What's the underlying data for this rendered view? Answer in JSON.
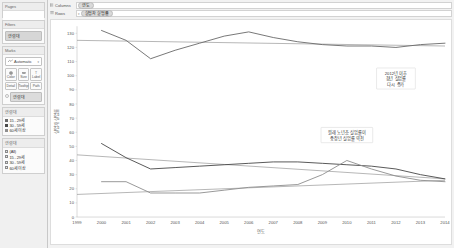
{
  "sidebar": {
    "pages": {
      "title": "Pages"
    },
    "filters": {
      "title": "Filters",
      "pills": [
        "연령대"
      ]
    },
    "marks": {
      "title": "Marks",
      "type_label": "Automatic",
      "type_icon": "line-mark-icon",
      "caret": "▾",
      "buttons_row1": [
        {
          "label": "Color",
          "icon": "color-icon"
        },
        {
          "label": "Size",
          "icon": "size-icon"
        },
        {
          "label": "Label",
          "icon": "label-icon"
        }
      ],
      "buttons_row2": [
        {
          "label": "Detail",
          "icon": "detail-icon"
        },
        {
          "label": "Tooltip",
          "icon": "tooltip-icon"
        },
        {
          "label": "Path",
          "icon": "path-icon"
        }
      ],
      "mark_pill": "연령대",
      "mark_pill_icon": "color-legend-icon"
    },
    "color_legend": {
      "title": "연령대",
      "items": [
        {
          "label": "15 - 29세",
          "color": "#6b6b6b"
        },
        {
          "label": "30 - 59세",
          "color": "#4a4a4a"
        },
        {
          "label": "60세 이상",
          "color": "#8f8f8f"
        }
      ]
    },
    "filter_legend": {
      "title": "연령대",
      "items": [
        {
          "label": "(All)",
          "checked": true
        },
        {
          "label": "15 - 29세",
          "checked": true
        },
        {
          "label": "30 - 59세",
          "checked": true
        },
        {
          "label": "60세 이상",
          "checked": true
        }
      ]
    }
  },
  "shelves": {
    "columns_label": "Columns",
    "columns_icon": "columns-icon",
    "columns_pill": "연도",
    "rows_label": "Rows",
    "rows_icon": "rows-icon",
    "rows_pill": "실업자 실업률",
    "rows_caret": "▾"
  },
  "chart_data": {
    "type": "line",
    "title": "",
    "xlabel": "연도",
    "ylabel": "실업자 실업률",
    "x": [
      1999,
      2000,
      2001,
      2002,
      2003,
      2004,
      2005,
      2006,
      2007,
      2008,
      2009,
      2010,
      2011,
      2012,
      2013,
      2014
    ],
    "xlim": [
      1999,
      2014
    ],
    "ylim": [
      0,
      135
    ],
    "yticks": [
      0,
      10,
      20,
      30,
      40,
      50,
      60,
      70,
      80,
      90,
      100,
      110,
      120,
      130
    ],
    "grid": false,
    "legend_position": "sidebar",
    "series": [
      {
        "name": "15 - 29세",
        "color": "#6b6b6b",
        "values": [
          null,
          132,
          125,
          112,
          118,
          123,
          128,
          131,
          127,
          124,
          122,
          121,
          121,
          120,
          122,
          123
        ]
      },
      {
        "name": "30 - 59세",
        "color": "#4a4a4a",
        "values": [
          null,
          52,
          42,
          34,
          35,
          36,
          37,
          38,
          39,
          39,
          38,
          37,
          36,
          34,
          30,
          27
        ]
      },
      {
        "name": "60세 이상",
        "color": "#8f8f8f",
        "values": [
          null,
          25,
          25,
          17,
          17,
          17,
          19,
          21,
          22,
          23,
          30,
          40,
          34,
          29,
          26,
          25
        ]
      }
    ],
    "trend_lines": [
      {
        "name": "15 - 29세 추세",
        "color": "#9a9a9a",
        "from": [
          1999,
          125
        ],
        "to": [
          2014,
          121
        ]
      },
      {
        "name": "30 - 59세 추세",
        "color": "#9a9a9a",
        "from": [
          1999,
          44
        ],
        "to": [
          2014,
          27
        ]
      },
      {
        "name": "60세 이상 추세",
        "color": "#9a9a9a",
        "from": [
          1999,
          16
        ],
        "to": [
          2014,
          26
        ]
      }
    ],
    "annotations": [
      {
        "id": "annotation-youth",
        "lines": [
          "2012년 이후",
          "청년 실업률",
          "다시 증가"
        ],
        "x": 2012,
        "y": 98
      },
      {
        "id": "annotation-elderly",
        "lines": [
          "원래 노년층 실업률이",
          "중장년 실업률 역전"
        ],
        "x": 2010,
        "y": 58
      }
    ]
  }
}
